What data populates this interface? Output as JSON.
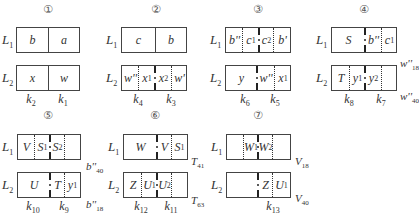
{
  "panels": [
    {
      "number": "①",
      "L1": {
        "row_label": "L",
        "row_sub": "1",
        "cells": [
          {
            "text": "b",
            "sub": ""
          },
          {
            "text": "a",
            "sub": ""
          }
        ]
      },
      "L2": {
        "row_label": "L",
        "row_sub": "2",
        "cells": [
          {
            "text": "x",
            "sub": ""
          },
          {
            "text": "w",
            "sub": ""
          }
        ]
      },
      "k_labels": [
        {
          "text": "k",
          "sub": "2"
        },
        {
          "text": "k",
          "sub": "1"
        }
      ],
      "side_labels": []
    },
    {
      "number": "②",
      "L1": {
        "row_label": "L",
        "row_sub": "1",
        "cells": [
          {
            "text": "c",
            "sub": ""
          },
          {
            "text": "b",
            "sub": ""
          }
        ]
      },
      "L2": {
        "row_label": "L",
        "row_sub": "2",
        "cells": [
          {
            "text": "w''",
            "sub": ""
          },
          {
            "text": "x",
            "sub": "1"
          },
          {
            "text": "x",
            "sub": "2"
          },
          {
            "text": "w'",
            "sub": ""
          }
        ]
      },
      "k_labels": [
        {
          "text": "k",
          "sub": "4"
        },
        {
          "text": "k",
          "sub": "3"
        }
      ],
      "side_labels": []
    },
    {
      "number": "③",
      "L1": {
        "row_label": "L",
        "row_sub": "1",
        "cells": [
          {
            "text": "b''",
            "sub": ""
          },
          {
            "text": "c",
            "sub": "1"
          },
          {
            "text": "c",
            "sub": "2"
          },
          {
            "text": "b'",
            "sub": ""
          }
        ]
      },
      "L2": {
        "row_label": "L",
        "row_sub": "2",
        "cells": [
          {
            "text": "y",
            "sub": ""
          },
          {
            "text": "w''",
            "sub": ""
          },
          {
            "text": "x",
            "sub": "1"
          }
        ]
      },
      "k_labels": [
        {
          "text": "k",
          "sub": "6"
        },
        {
          "text": "k",
          "sub": "5"
        }
      ],
      "side_labels": []
    },
    {
      "number": "④",
      "L1": {
        "row_label": "L",
        "row_sub": "1",
        "cells": [
          {
            "text": "S",
            "sub": ""
          },
          {
            "text": "b''",
            "sub": ""
          },
          {
            "text": "c",
            "sub": "1"
          }
        ]
      },
      "L2": {
        "row_label": "L",
        "row_sub": "2",
        "cells": [
          {
            "text": "T",
            "sub": ""
          },
          {
            "text": "y",
            "sub": "1"
          },
          {
            "text": "y",
            "sub": "2"
          },
          {
            "text": "",
            "sub": ""
          }
        ]
      },
      "k_labels": [
        {
          "text": "k",
          "sub": "8"
        },
        {
          "text": "k",
          "sub": "7"
        }
      ],
      "side_labels": [
        {
          "text": "w''",
          "sub": "18"
        },
        {
          "text": "w''",
          "sub": "40"
        }
      ]
    },
    {
      "number": "⑤",
      "L1": {
        "row_label": "L",
        "row_sub": "1",
        "cells": [
          {
            "text": "V",
            "sub": ""
          },
          {
            "text": "S",
            "sub": "1"
          },
          {
            "text": "S",
            "sub": "2"
          },
          {
            "text": "",
            "sub": ""
          }
        ]
      },
      "L2": {
        "row_label": "L",
        "row_sub": "2",
        "cells": [
          {
            "text": "U",
            "sub": ""
          },
          {
            "text": "T",
            "sub": ""
          },
          {
            "text": "y",
            "sub": "1"
          }
        ]
      },
      "k_labels": [
        {
          "text": "k",
          "sub": "10"
        },
        {
          "text": "k",
          "sub": "9"
        }
      ],
      "side_labels": [
        {
          "text": "b''",
          "sub": "40"
        },
        {
          "text": "b''",
          "sub": "18"
        }
      ]
    },
    {
      "number": "⑥",
      "L1": {
        "row_label": "L",
        "row_sub": "1",
        "cells": [
          {
            "text": "W",
            "sub": ""
          },
          {
            "text": "V",
            "sub": ""
          },
          {
            "text": "S",
            "sub": "1"
          }
        ]
      },
      "L2": {
        "row_label": "L",
        "row_sub": "2",
        "cells": [
          {
            "text": "Z",
            "sub": ""
          },
          {
            "text": "U",
            "sub": "1"
          },
          {
            "text": "U",
            "sub": "2"
          },
          {
            "text": "",
            "sub": ""
          }
        ]
      },
      "k_labels": [
        {
          "text": "k",
          "sub": "12"
        },
        {
          "text": "k",
          "sub": "11"
        }
      ],
      "side_labels": [
        {
          "text": "T",
          "sub": "41"
        },
        {
          "text": "T",
          "sub": "63"
        }
      ]
    },
    {
      "number": "⑦",
      "L1": {
        "row_label": "L",
        "row_sub": "1",
        "cells": [
          {
            "text": "",
            "sub": ""
          },
          {
            "text": "W",
            "sub": "1"
          },
          {
            "text": "W",
            "sub": "2"
          },
          {
            "text": "",
            "sub": ""
          }
        ]
      },
      "L2": {
        "row_label": "L",
        "row_sub": "2",
        "cells": [
          {
            "text": "",
            "sub": ""
          },
          {
            "text": "Z",
            "sub": ""
          },
          {
            "text": "U",
            "sub": "1"
          }
        ]
      },
      "k_labels": [
        {
          "text": "k",
          "sub": "13"
        }
      ],
      "side_labels": [
        {
          "text": "V",
          "sub": "18"
        },
        {
          "text": "V",
          "sub": "40"
        }
      ]
    }
  ]
}
